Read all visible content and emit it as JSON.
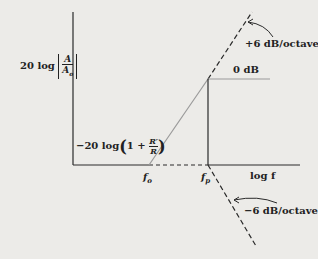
{
  "diagram": {
    "type": "bode-asymptote",
    "y_axis_label": "20 log |A / A_o|",
    "y_axis_label_parts": {
      "prefix": "20 log",
      "num": "A",
      "den": "A",
      "den_sub": "o"
    },
    "x_axis_label": "log f",
    "low_level_label": "−20 log(1 + R′/R)",
    "low_level_parts": {
      "prefix": "−20 log",
      "one_plus": "1 +",
      "num": "R′",
      "den": "R"
    },
    "zero_db_label": "0 dB",
    "slope_up_label": "+6 dB/octave",
    "slope_down_label": "−6 dB/octave",
    "freq_markers": [
      {
        "name": "f",
        "sub": "o"
      },
      {
        "name": "f",
        "sub": "p"
      }
    ],
    "colors": {
      "line": "#2a2a2a",
      "slope": "#9a9a9a",
      "background": "#ecebe8"
    }
  }
}
